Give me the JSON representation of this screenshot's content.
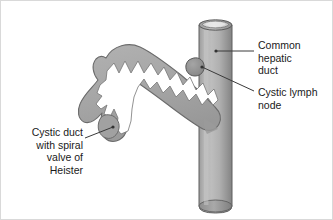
{
  "figure": {
    "background_color": "#ffffff",
    "border_color": "#d9d9d9"
  },
  "labels": {
    "common_hepatic_duct": "Common\nhepatic\nduct",
    "cystic_lymph_node": "Cystic lymph\nnode",
    "cystic_duct": "Cystic duct\nwith spiral\nvalve of\nHeister"
  },
  "structures": {
    "common_hepatic_duct": {
      "name": "Common hepatic duct",
      "shape": "vertical-cylindrical-tube",
      "fill_light": "#b7b7b7",
      "fill_mid": "#a3a3a3",
      "fill_dark": "#8a8a8a",
      "outline": "#5a5a5a",
      "lumen_color": "#ededed"
    },
    "cystic_duct": {
      "name": "Cystic duct with spiral valve of Heister",
      "shape": "arched-tube-with-zigzag-lumen",
      "fill": "#a8a8a8",
      "outline": "#6b6b6b",
      "lumen_color": "#ffffff"
    },
    "cystic_lymph_node": {
      "name": "Cystic lymph node",
      "shape": "oval-nodule",
      "fill": "#8f8f8f",
      "outline": "#5a5a5a"
    }
  },
  "leader_lines": {
    "color": "#3a3a3a",
    "common_hepatic_duct": "horizontal dash from tube to label",
    "cystic_lymph_node": "diagonal from node down-right to label",
    "cystic_duct": "diagonal from label up-right to duct lobe"
  },
  "colors": {
    "text": "#1a1a1a",
    "outline": "#5a5a5a",
    "tissue_gray": "#a8a8a8"
  }
}
